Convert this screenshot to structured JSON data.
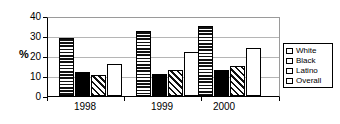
{
  "chart_data": {
    "type": "bar",
    "title": "",
    "xlabel": "",
    "ylabel": "%",
    "categories": [
      "1998",
      "1999",
      "2000"
    ],
    "series": [
      {
        "name": "White",
        "pattern": "horizontal-stripes",
        "values": [
          29,
          32.5,
          35
        ]
      },
      {
        "name": "Black",
        "pattern": "solid-black",
        "values": [
          12,
          11,
          13
        ]
      },
      {
        "name": "Latino",
        "pattern": "diagonal-hatch",
        "values": [
          10.5,
          13,
          15
        ]
      },
      {
        "name": "Overall",
        "pattern": "white-open",
        "values": [
          16,
          22,
          24
        ]
      }
    ],
    "ylim": [
      0,
      40
    ],
    "yticks": [
      0,
      10,
      20,
      30,
      40
    ],
    "ytick_labels": [
      "0",
      "10",
      "20",
      "30",
      "40"
    ],
    "grid": true,
    "legend_position": "right-outside"
  },
  "legend": {
    "items": [
      {
        "label": "White"
      },
      {
        "label": "Black"
      },
      {
        "label": "Latino"
      },
      {
        "label": "Overall"
      }
    ]
  },
  "colors": {
    "axis": "#000000",
    "gridline": "#b5b5b5",
    "bar_outline": "#000000",
    "background": "#ffffff"
  }
}
